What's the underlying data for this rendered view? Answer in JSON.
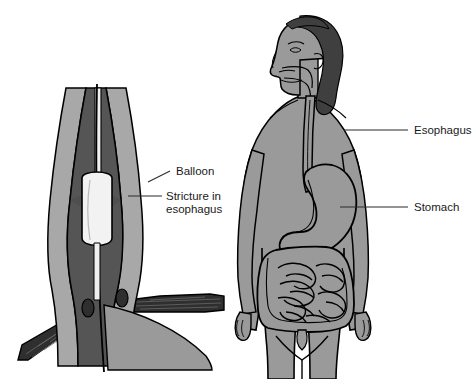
{
  "figure": {
    "background_color": "#ffffff"
  },
  "palette": {
    "body_gray": "#9a9a9a",
    "organ_gray": "#9a9a9a",
    "muscle_gray": "#a8a8a8",
    "lumen_dark": "#555555",
    "hair_dark": "#3f3f3f",
    "diaphragm_dark": "#2f2f2f",
    "balloon_white": "#f2f2f2",
    "outline_black": "#000000",
    "label_text": "#1a1a1a",
    "leader_line": "#2b2b2b"
  },
  "left_panel": {
    "name": "balloon-dilation-detail",
    "description": "Cross-section of lower esophagus with inflated dilation balloon at a stricture, passing through the diaphragm into the stomach",
    "labels": [
      {
        "id": "balloon",
        "text": "Balloon",
        "text_x": 176,
        "text_y": 175,
        "leader": "M 148 182 L 170 171"
      },
      {
        "id": "stricture",
        "text": "Stricture in",
        "text2": "esophagus",
        "text_x": 166,
        "text_y": 200,
        "text2_y": 213,
        "leader": "M 128 196 L 162 196"
      }
    ]
  },
  "right_panel": {
    "name": "human-figure-gi-tract",
    "description": "Standing human figure in profile-head view showing esophagus, stomach and intestines",
    "labels": [
      {
        "id": "esophagus",
        "text": "Esophagus",
        "text_x": 414,
        "text_y": 134,
        "leader": "M 344 130 L 408 130"
      },
      {
        "id": "stomach",
        "text": "Stomach",
        "text_x": 414,
        "text_y": 211,
        "leader": "M 340 207 L 408 207"
      }
    ]
  }
}
